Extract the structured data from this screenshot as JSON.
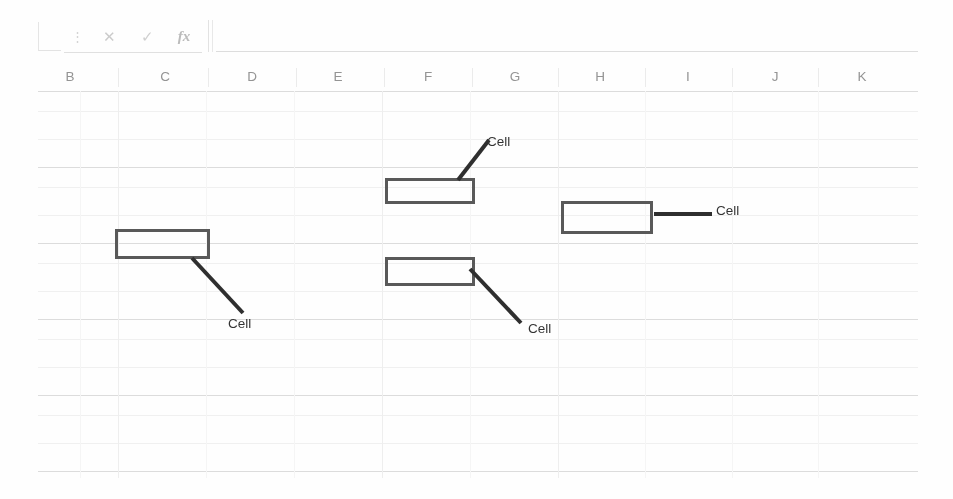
{
  "app": {
    "type": "spreadsheet-annotation-screenshot",
    "width": 953,
    "height": 499,
    "background_color": "#fefefe"
  },
  "formula_bar": {
    "name_box_value": "",
    "formula_input_value": "",
    "icons": [
      {
        "name": "menu-dots-icon",
        "glyph": "⋮",
        "class": "dots"
      },
      {
        "name": "cancel-x-icon",
        "glyph": "✕",
        "class": "x"
      },
      {
        "name": "confirm-check-icon",
        "glyph": "✓",
        "class": "check"
      },
      {
        "name": "insert-function-icon",
        "glyph": "fx",
        "class": "fx"
      }
    ]
  },
  "column_headers": {
    "labels": [
      "B",
      "C",
      "D",
      "E",
      "F",
      "G",
      "H",
      "I",
      "J",
      "K"
    ],
    "centers": [
      70,
      165,
      252,
      338,
      428,
      515,
      600,
      688,
      775,
      862
    ],
    "dividers": [
      118,
      208,
      296,
      384,
      472,
      558,
      645,
      732,
      818
    ],
    "text_color": "#8a8a8a",
    "underline_color": "#bdbdbd"
  },
  "grid": {
    "origin_x": 38,
    "origin_y": 91,
    "width": 880,
    "height": 387,
    "row_offsets": [
      0,
      20,
      48,
      76,
      96,
      124,
      152,
      172,
      200,
      228,
      248,
      276,
      304,
      324,
      352,
      380
    ],
    "row_weights": [
      "strong",
      "faint",
      "faint",
      "strong",
      "faint",
      "faint",
      "strong",
      "faint",
      "faint",
      "strong",
      "faint",
      "faint",
      "strong",
      "faint",
      "faint",
      "strong"
    ],
    "col_offsets": [
      42,
      80,
      168,
      256,
      344,
      432,
      520,
      607,
      694,
      780
    ],
    "col_weights": [
      "soft",
      "normal",
      "soft",
      "soft",
      "normal",
      "soft",
      "normal",
      "soft",
      "soft",
      "soft"
    ],
    "line_color_strong": "#d8d8d8",
    "line_color_faint": "#efefef",
    "line_color_col": "#ececec"
  },
  "annotations": {
    "boxes": [
      {
        "id": "box-1",
        "x": 115,
        "y": 229,
        "w": 95,
        "h": 30
      },
      {
        "id": "box-2",
        "x": 385,
        "y": 178,
        "w": 90,
        "h": 26
      },
      {
        "id": "box-3",
        "x": 561,
        "y": 201,
        "w": 92,
        "h": 33
      },
      {
        "id": "box-4",
        "x": 385,
        "y": 257,
        "w": 90,
        "h": 29
      }
    ],
    "leaders": [
      {
        "id": "leader-1",
        "x1": 192,
        "y1": 258,
        "x2": 243,
        "y2": 313
      },
      {
        "id": "leader-2",
        "x1": 458,
        "y1": 180,
        "x2": 489,
        "y2": 140
      },
      {
        "id": "leader-3",
        "x1": 654,
        "y1": 214,
        "x2": 712,
        "y2": 214
      },
      {
        "id": "leader-4",
        "x1": 470,
        "y1": 269,
        "x2": 521,
        "y2": 323
      }
    ],
    "labels": [
      {
        "id": "label-1",
        "text": "Cell",
        "x": 228,
        "y": 316
      },
      {
        "id": "label-2",
        "text": "Cell",
        "x": 487,
        "y": 134
      },
      {
        "id": "label-3",
        "text": "Cell",
        "x": 716,
        "y": 203
      },
      {
        "id": "label-4",
        "text": "Cell",
        "x": 528,
        "y": 321
      }
    ],
    "box_border_color": "#4a4a4a",
    "leader_color": "#1c1c1c",
    "label_color": "#1f1f1f"
  }
}
